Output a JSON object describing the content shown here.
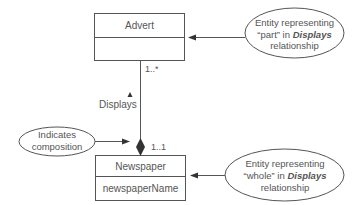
{
  "diagram": {
    "type": "UML class diagram - composition",
    "classes": [
      {
        "name": "Advert",
        "attributes": [
          ""
        ]
      },
      {
        "name": "Newspaper",
        "attributes": [
          "newspaperName"
        ]
      }
    ],
    "association": {
      "name": "Displays",
      "multiplicity_advert": "1..*",
      "multiplicity_newspaper": "1..1"
    },
    "annotations": {
      "part": {
        "line1": "Entity representing",
        "line2_pre": "“part” in ",
        "line2_em": "Displays",
        "line3": "relationship"
      },
      "whole": {
        "line1": "Entity representing",
        "line2_pre": "“whole” in ",
        "line2_em": "Displays",
        "line3": "relationship"
      },
      "composition": {
        "line1": "Indicates",
        "line2": "composition"
      }
    },
    "colors": {
      "stroke": "#555555",
      "text": "#555555",
      "fill": "#ffffff"
    }
  }
}
